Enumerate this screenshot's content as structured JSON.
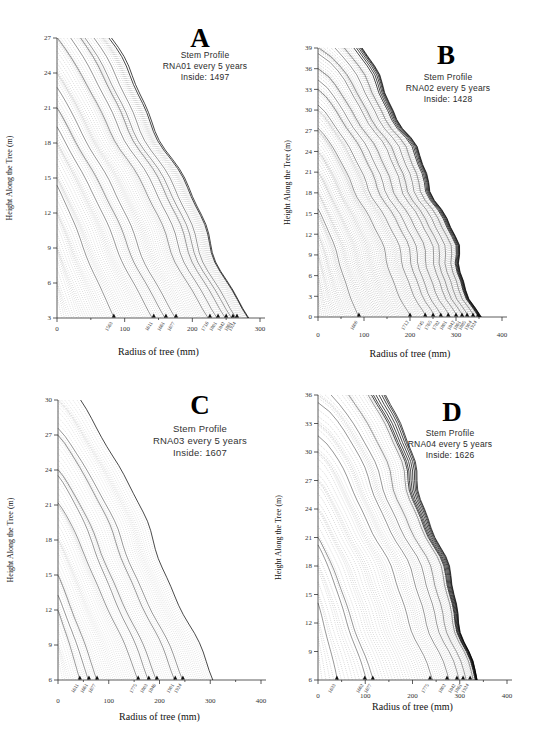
{
  "figure": {
    "background": "#ffffff",
    "ink_color": "#1a1a1a"
  },
  "chart_data": [
    {
      "type": "line",
      "panel": "A",
      "annotation": {
        "letter": "A",
        "lines": [
          "Stem Profile",
          "RNA01 every 5 years",
          "Inside: 1497"
        ]
      },
      "inside_year": 1497,
      "interval_years": 5,
      "xlabel": "Radius of tree (mm)",
      "ylabel": "Height Along the Tree (m)",
      "xlim": [
        0,
        300
      ],
      "ylim": [
        3,
        27
      ],
      "xticks": [
        0,
        100,
        200,
        300
      ],
      "xminor": 50,
      "yticks": [
        3,
        6,
        9,
        12,
        15,
        18,
        21,
        24,
        27
      ],
      "grid": false,
      "legend": "none",
      "series_description": "fan of ~97 dotted stem-profile curves, one per 5-year step since inside year; arrows mark dated profiles at base",
      "markers": [
        {
          "year": "1563",
          "radius": 84
        },
        {
          "year": "1611",
          "radius": 143
        },
        {
          "year": "1661",
          "radius": 161
        },
        {
          "year": "1677",
          "radius": 176
        },
        {
          "year": "1716",
          "radius": 226
        },
        {
          "year": "1801",
          "radius": 238
        },
        {
          "year": "1842",
          "radius": 250
        },
        {
          "year": "1861",
          "radius": 260
        },
        {
          "year": "1924",
          "radius": 266
        }
      ],
      "model": {
        "n": 97,
        "h_range": 24,
        "h_sat": 0.7,
        "h_exp": 0.75,
        "stair": 0.9,
        "max_r": 285,
        "r_mode": "sat",
        "r_exp": 1.25,
        "taper0": 1.0,
        "taper1": -0.1,
        "wig": 6,
        "seed": 1.3,
        "dark_last": 2,
        "ink": 0.65
      },
      "layout": {
        "left": 57,
        "right": 260,
        "top": 38,
        "bottom": 318,
        "tickdy": 13,
        "xlabdy": 37,
        "ylabx": 12
      }
    },
    {
      "type": "line",
      "panel": "B",
      "annotation": {
        "letter": "B",
        "lines": [
          "Stem Profile",
          "RNA02 every 5 years",
          "Inside: 1428"
        ]
      },
      "inside_year": 1428,
      "interval_years": 5,
      "xlabel": "Radius of tree (mm)",
      "ylabel": "Height Along the Tree (m)",
      "xlim": [
        0,
        400
      ],
      "ylim": [
        0,
        39
      ],
      "xticks": [
        0,
        100,
        200,
        300,
        400
      ],
      "xminor": 50,
      "yticks": [
        0,
        3,
        6,
        9,
        12,
        15,
        18,
        21,
        24,
        27,
        30,
        33,
        36,
        39
      ],
      "grid": false,
      "legend": "none",
      "series_description": "fan of ~110 dotted stem-profile curves, one per 5-year step since inside year; arrows mark dated profiles at base",
      "markers": [
        {
          "year": "1600",
          "radius": 89
        },
        {
          "year": "1712",
          "radius": 200
        },
        {
          "year": "1745",
          "radius": 233
        },
        {
          "year": "1765",
          "radius": 250
        },
        {
          "year": "1782",
          "radius": 267
        },
        {
          "year": "1801",
          "radius": 283
        },
        {
          "year": "1842",
          "radius": 300
        },
        {
          "year": "1861",
          "radius": 313
        },
        {
          "year": "1885",
          "radius": 324
        },
        {
          "year": "1904",
          "radius": 337
        },
        {
          "year": "1924",
          "radius": 348
        }
      ],
      "model": {
        "n": 110,
        "h_range": 39,
        "h_sat": 0.8,
        "h_exp": 0.62,
        "stair": 0.9,
        "max_r": 350,
        "r_mode": "sat",
        "r_exp": 1.35,
        "taper0": 0.95,
        "taper1": -0.3,
        "wig": 8,
        "seed": 2.1,
        "dark_last": 6,
        "ink": 0.8
      },
      "layout": {
        "left": 318,
        "right": 502,
        "top": 48,
        "bottom": 317,
        "tickdy": 20,
        "xlabdy": 40,
        "ylabx": 290
      }
    },
    {
      "type": "line",
      "panel": "C",
      "annotation": {
        "letter": "C",
        "lines": [
          "Stem Profile",
          "RNA03 every 5 years",
          "Inside: 1607"
        ]
      },
      "inside_year": 1607,
      "interval_years": 5,
      "xlabel": "Radius of tree (mm)",
      "ylabel": "Height Along the Tree (m)",
      "xlim": [
        0,
        400
      ],
      "ylim": [
        6,
        30
      ],
      "xticks": [
        0,
        100,
        200,
        300,
        400
      ],
      "xminor": 50,
      "yticks": [
        6,
        9,
        12,
        15,
        18,
        21,
        24,
        27,
        30
      ],
      "grid": false,
      "legend": "none",
      "series_description": "fan of ~75 dotted stem-profile curves, one per 5-year step since inside year; arrows mark dated profiles at base",
      "markers": [
        {
          "year": "1611",
          "radius": 43
        },
        {
          "year": "1661",
          "radius": 61
        },
        {
          "year": "1677",
          "radius": 77
        },
        {
          "year": "1775",
          "radius": 158
        },
        {
          "year": "1803",
          "radius": 179
        },
        {
          "year": "1846",
          "radius": 195
        },
        {
          "year": "1901",
          "radius": 231
        },
        {
          "year": "1924",
          "radius": 246
        }
      ],
      "model": {
        "n": 75,
        "h_range": 24,
        "h_sat": 0.9,
        "h_exp": 0.75,
        "stair": 0.9,
        "max_r": 305,
        "r_mode": "pow",
        "r_exp": 0.97,
        "taper0": 0.95,
        "taper1": -0.15,
        "wig": 5,
        "seed": 3.7,
        "dark_last": 1,
        "ink": 0.5
      },
      "layout": {
        "left": 58,
        "right": 261,
        "top": 400,
        "bottom": 680,
        "tickdy": 23,
        "xlabdy": 40,
        "ylabx": 13
      }
    },
    {
      "type": "line",
      "panel": "D",
      "annotation": {
        "letter": "D",
        "lines": [
          "Stem Profile",
          "RNA04 every 5 years",
          "Inside: 1626"
        ]
      },
      "inside_year": 1626,
      "interval_years": 5,
      "xlabel": "Radius of tree (mm)",
      "ylabel": "Height Along the Tree (m)",
      "xlim": [
        0,
        400
      ],
      "ylim": [
        6,
        36
      ],
      "xticks": [
        0,
        100,
        200,
        300,
        400
      ],
      "xminor": 50,
      "yticks": [
        6,
        9,
        12,
        15,
        18,
        21,
        24,
        27,
        30,
        33,
        36
      ],
      "grid": false,
      "legend": "none",
      "series_description": "fan of ~71 dotted stem-profile curves, one per 5-year step since inside year; arrows mark dated profiles at base",
      "markers": [
        {
          "year": "1633",
          "radius": 40
        },
        {
          "year": "1662",
          "radius": 99
        },
        {
          "year": "1677",
          "radius": 116
        },
        {
          "year": "1775",
          "radius": 237
        },
        {
          "year": "1802",
          "radius": 273
        },
        {
          "year": "1842",
          "radius": 294
        },
        {
          "year": "1861",
          "radius": 307
        },
        {
          "year": "1924",
          "radius": 322
        }
      ],
      "model": {
        "n": 71,
        "h_range": 30,
        "h_sat": 0.66,
        "h_exp": 0.6,
        "stair": 0.9,
        "max_r": 330,
        "r_mode": "sat",
        "r_exp": 1.8,
        "taper0": 0.95,
        "taper1": -0.4,
        "wig": 7,
        "seed": 5.2,
        "dark_last": 7,
        "ink": 0.7
      },
      "layout": {
        "left": 318,
        "right": 507,
        "top": 395,
        "bottom": 680,
        "tickdy": 18,
        "xlabdy": 30,
        "ylabx": 281
      }
    }
  ]
}
